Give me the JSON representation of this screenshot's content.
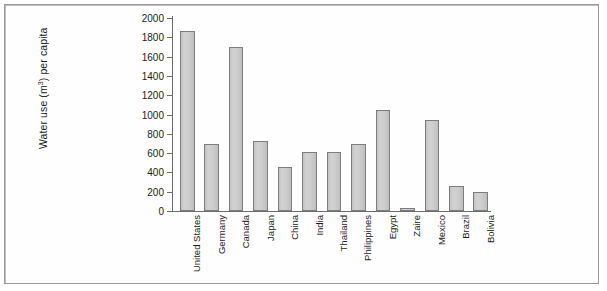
{
  "chart_data": {
    "type": "bar",
    "title": "",
    "xlabel": "",
    "ylabel": "Water use (m3) per capita",
    "ylabel_parts": {
      "pre": "Water use (m",
      "sup": "3",
      "post": ") per capita"
    },
    "ylim": [
      0,
      2000
    ],
    "yticks": [
      0,
      200,
      400,
      600,
      800,
      1000,
      1200,
      1400,
      1600,
      1800,
      2000
    ],
    "grid": false,
    "legend": "none",
    "categories": [
      "United States",
      "Germany",
      "Canada",
      "Japan",
      "China",
      "India",
      "Thailand",
      "Philippines",
      "Egypt",
      "Zaire",
      "Mexico",
      "Brazil",
      "Bolivia"
    ],
    "values": [
      1870,
      690,
      1700,
      730,
      460,
      615,
      615,
      690,
      1050,
      30,
      940,
      255,
      200
    ],
    "bar_fill_color": "#c9c9c9",
    "bar_edge_color": "#7d7d7d",
    "axis_color": "#6d6d6d",
    "background_color": "#ffffff",
    "frame_color": "#9a9a9a"
  }
}
